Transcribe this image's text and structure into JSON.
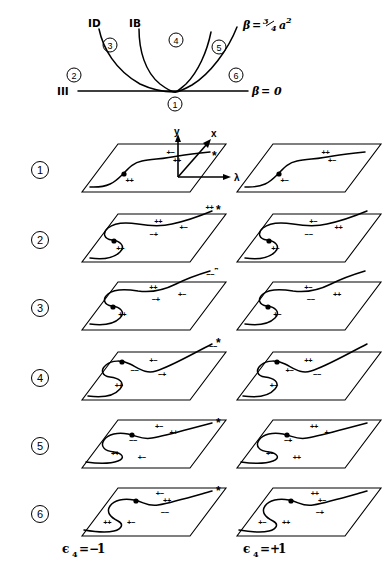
{
  "figure": {
    "title_present": false,
    "phase_diagram": {
      "name": "phase-diagram",
      "boundary_labels": [
        {
          "id": "D",
          "text": "ⅱⅠ",
          "display": "ID",
          "x": 92,
          "y": 24
        },
        {
          "id": "B",
          "text": "ℭ",
          "display": "IB",
          "x": 133,
          "y": 24
        },
        {
          "id": "H",
          "text": "Ⅲ",
          "display": "III",
          "x": 62,
          "y": 94
        }
      ],
      "region_labels": [
        {
          "label": "2",
          "x": 74,
          "y": 78
        },
        {
          "label": "3",
          "x": 109,
          "y": 48
        },
        {
          "label": "4",
          "x": 175,
          "y": 42
        },
        {
          "label": "5",
          "x": 220,
          "y": 50
        },
        {
          "label": "6",
          "x": 236,
          "y": 78
        },
        {
          "label": "1",
          "x": 174,
          "y": 105
        }
      ],
      "curve_label_top": "β = ¾ a²",
      "curve_label_top_parts": {
        "beta": "β",
        "eq": "=",
        "frac_num": "3",
        "frac_den": "4",
        "base": "a",
        "exp": "2"
      },
      "baseline_label": "β = 0",
      "baseline_label_parts": {
        "beta": "β",
        "eq": "= 0"
      }
    },
    "axes_key": {
      "name": "axes-key",
      "labels": {
        "y": "y",
        "x": "x",
        "lambda": "λ"
      }
    },
    "columns": [
      {
        "id": "left",
        "footer": "ε4 = −1",
        "footer_parts": {
          "sym": "ϵ",
          "sub": "4",
          "eq": "=−",
          "val": "1"
        },
        "epsilon4": -1
      },
      {
        "id": "right",
        "footer": "ε4 = +1",
        "footer_parts": {
          "sym": "ϵ",
          "sub": "4",
          "eq": "=+",
          "val": "1"
        },
        "epsilon4": 1
      }
    ],
    "rows": [
      {
        "number": "1",
        "circled": "①",
        "left": {
          "shape": "monotone-s",
          "has_star": true,
          "star": "*",
          "signs": [
            {
              "text": "+−",
              "x": 0.56,
              "y": 0.22
            },
            {
              "text": "++",
              "x": 0.68,
              "y": 0.4
            },
            {
              "text": "++",
              "x": 0.38,
              "y": 0.82
            }
          ]
        },
        "right": {
          "shape": "monotone-s",
          "has_star": false,
          "signs": [
            {
              "text": "++",
              "x": 0.56,
              "y": 0.22
            },
            {
              "text": "+−",
              "x": 0.68,
              "y": 0.4
            },
            {
              "text": "+−",
              "x": 0.38,
              "y": 0.82
            }
          ]
        }
      },
      {
        "number": "2",
        "circled": "②",
        "left": {
          "shape": "s-fold",
          "has_star": true,
          "star": "*",
          "signs": [
            {
              "text": "++",
              "x": 0.44,
              "y": 0.2
            },
            {
              "text": "+−",
              "x": 0.72,
              "y": 0.34
            },
            {
              "text": "−+",
              "x": 0.49,
              "y": 0.48
            },
            {
              "text": "++",
              "x": 0.28,
              "y": 0.78
            },
            {
              "text": "++",
              "x": 0.82,
              "y": -0.08
            }
          ]
        },
        "right": {
          "shape": "s-fold",
          "has_star": false,
          "signs": [
            {
              "text": "+−",
              "x": 0.44,
              "y": 0.2
            },
            {
              "text": "++",
              "x": 0.72,
              "y": 0.34
            },
            {
              "text": "−−",
              "x": 0.49,
              "y": 0.48
            },
            {
              "text": "+−",
              "x": 0.28,
              "y": 0.78
            }
          ]
        }
      },
      {
        "number": "3",
        "circled": "③",
        "left": {
          "shape": "s-fold-high",
          "has_star": true,
          "star": "*",
          "signs": [
            {
              "text": "++",
              "x": 0.38,
              "y": 0.16
            },
            {
              "text": "+−",
              "x": 0.7,
              "y": 0.32
            },
            {
              "text": "−+",
              "x": 0.49,
              "y": 0.42
            },
            {
              "text": "++",
              "x": 0.28,
              "y": 0.72
            },
            {
              "text": "−−",
              "x": 0.82,
              "y": -0.1
            }
          ]
        },
        "right": {
          "shape": "s-fold-high",
          "has_star": false,
          "signs": [
            {
              "text": "+−",
              "x": 0.38,
              "y": 0.16
            },
            {
              "text": "++",
              "x": 0.7,
              "y": 0.32
            },
            {
              "text": "−−",
              "x": 0.49,
              "y": 0.42
            },
            {
              "text": "+−",
              "x": 0.28,
              "y": 0.72
            }
          ]
        }
      },
      {
        "number": "4",
        "circled": "④",
        "left": {
          "shape": "s-cross",
          "has_star": true,
          "star": "*",
          "signs": [
            {
              "text": "−−",
              "x": 0.86,
              "y": -0.06
            },
            {
              "text": "+−",
              "x": 0.4,
              "y": 0.22
            },
            {
              "text": "−−",
              "x": 0.3,
              "y": 0.44
            },
            {
              "text": "−+",
              "x": 0.58,
              "y": 0.52
            },
            {
              "text": "++",
              "x": 0.26,
              "y": 0.76
            }
          ]
        },
        "right": {
          "shape": "s-cross",
          "has_star": false,
          "signs": [
            {
              "text": "++",
              "x": 0.4,
              "y": 0.22
            },
            {
              "text": "+−",
              "x": 0.3,
              "y": 0.44
            },
            {
              "text": "−−",
              "x": 0.58,
              "y": 0.52
            },
            {
              "text": "+−",
              "x": 0.26,
              "y": 0.76
            }
          ]
        }
      },
      {
        "number": "5",
        "circled": "⑤",
        "left": {
          "shape": "s-loop",
          "has_star": true,
          "star": "*",
          "signs": [
            {
              "text": "+−",
              "x": 0.44,
              "y": 0.18
            },
            {
              "text": "++",
              "x": 0.62,
              "y": 0.32
            },
            {
              "text": "−−",
              "x": 0.3,
              "y": 0.48
            },
            {
              "text": "++",
              "x": 0.22,
              "y": 0.74
            },
            {
              "text": "+−",
              "x": 0.5,
              "y": 0.84
            }
          ]
        },
        "right": {
          "shape": "s-loop",
          "has_star": false,
          "signs": [
            {
              "text": "++",
              "x": 0.44,
              "y": 0.18
            },
            {
              "text": "+−",
              "x": 0.62,
              "y": 0.32
            },
            {
              "text": "−+",
              "x": 0.3,
              "y": 0.48
            },
            {
              "text": "+−",
              "x": 0.22,
              "y": 0.74
            },
            {
              "text": "++",
              "x": 0.5,
              "y": 0.84
            }
          ]
        }
      },
      {
        "number": "6",
        "circled": "⑥",
        "left": {
          "shape": "s-loop2",
          "has_star": true,
          "star": "*",
          "signs": [
            {
              "text": "+−",
              "x": 0.44,
              "y": 0.16
            },
            {
              "text": "++",
              "x": 0.56,
              "y": 0.32
            },
            {
              "text": "−−",
              "x": 0.62,
              "y": 0.56
            },
            {
              "text": "++",
              "x": 0.16,
              "y": 0.78
            },
            {
              "text": "+−",
              "x": 0.38,
              "y": 0.78
            }
          ]
        },
        "right": {
          "shape": "s-loop2",
          "has_star": false,
          "signs": [
            {
              "text": "++",
              "x": 0.44,
              "y": 0.16
            },
            {
              "text": "+−",
              "x": 0.56,
              "y": 0.32
            },
            {
              "text": "−+",
              "x": 0.62,
              "y": 0.56
            },
            {
              "text": "+−",
              "x": 0.16,
              "y": 0.78
            },
            {
              "text": "++",
              "x": 0.38,
              "y": 0.78
            }
          ]
        }
      }
    ]
  },
  "colors": {
    "ink": "#000000",
    "background": "#ffffff"
  }
}
